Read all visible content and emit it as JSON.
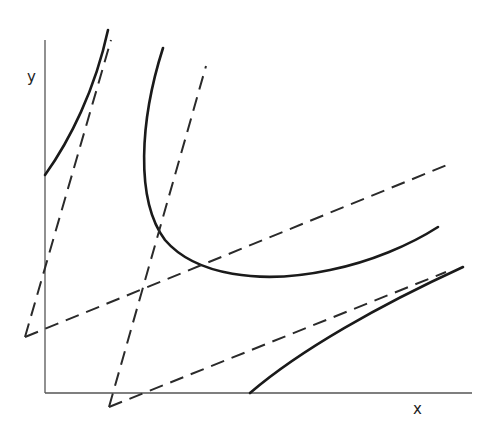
{
  "diagram": {
    "type": "conic-hyperbola-asymptotes",
    "axes": {
      "x_label": "x",
      "y_label": "y",
      "origin_px": [
        45,
        393
      ],
      "x_end_px": [
        472,
        393
      ],
      "y_end_px": [
        45,
        40
      ]
    },
    "colors": {
      "curve": "#1a1a1a",
      "asymptote": "#2a2a2a",
      "axis": "#555555",
      "background": "#ffffff"
    },
    "hyperbolas": [
      {
        "name": "hyperbola-1",
        "branches": [
          {
            "path": "M45,175 C70,140 95,90 108,30"
          },
          {
            "path": "M163,48 C140,120 135,200 165,240 C195,275 260,285 330,270 C370,262 410,245 438,227"
          }
        ],
        "asymptotes": [
          {
            "from": [
              25,
              337
            ],
            "to": [
              111,
              40
            ]
          },
          {
            "from": [
              25,
              337
            ],
            "to": [
              447,
              165
            ]
          }
        ]
      },
      {
        "name": "hyperbola-2",
        "branches": [
          {
            "path": "M250,393 C300,350 380,305 463,267"
          }
        ],
        "asymptotes": [
          {
            "from": [
              109,
              407
            ],
            "to": [
              206,
              66
            ]
          },
          {
            "from": [
              109,
              407
            ],
            "to": [
              446,
              272
            ]
          }
        ]
      }
    ]
  }
}
